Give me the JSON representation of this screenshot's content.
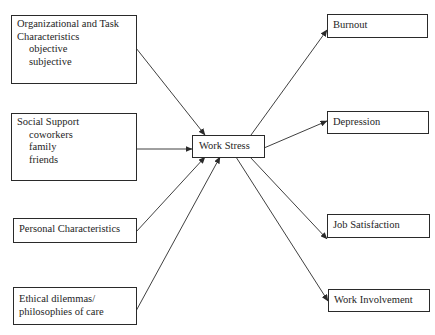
{
  "diagram": {
    "center": {
      "label": "Work Stress"
    },
    "inputs": [
      {
        "title_line1": "Organizational and Task",
        "title_line2": "Characteristics",
        "items": [
          "objective",
          "subjective"
        ]
      },
      {
        "title": "Social Support",
        "items": [
          "coworkers",
          "family",
          "friends"
        ]
      },
      {
        "title": "Personal Characteristics"
      },
      {
        "title_line1": "Ethical dilemmas/",
        "title_line2": "philosophies of care"
      }
    ],
    "outputs": [
      {
        "label": "Burnout"
      },
      {
        "label": "Depression"
      },
      {
        "label": "Job Satisfaction"
      },
      {
        "label": "Work Involvement"
      }
    ],
    "edges": [
      {
        "from": "Organizational and Task Characteristics",
        "to": "Work Stress"
      },
      {
        "from": "Social Support",
        "to": "Work Stress"
      },
      {
        "from": "Personal Characteristics",
        "to": "Work Stress"
      },
      {
        "from": "Ethical dilemmas/philosophies of care",
        "to": "Work Stress"
      },
      {
        "from": "Work Stress",
        "to": "Burnout"
      },
      {
        "from": "Work Stress",
        "to": "Depression"
      },
      {
        "from": "Work Stress",
        "to": "Job Satisfaction"
      },
      {
        "from": "Work Stress",
        "to": "Work Involvement"
      }
    ],
    "colors": {
      "line": "#2a2a2a",
      "background": "#ffffff"
    }
  }
}
